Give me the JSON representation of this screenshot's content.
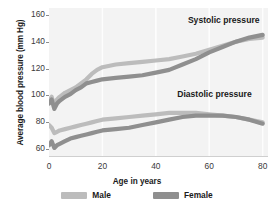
{
  "chart_data": {
    "type": "line",
    "title": "",
    "xlabel": "Age in years",
    "ylabel": "Average blood pressure (mm Hg)",
    "xlim": [
      0,
      82
    ],
    "ylim": [
      55,
      165
    ],
    "xticks": [
      0,
      20,
      40,
      60,
      80
    ],
    "yticks": [
      60,
      80,
      100,
      120,
      140,
      160
    ],
    "grid": "faint-vertical",
    "legend_position": "bottom-center",
    "annotations": [
      {
        "text": "Systolic pressure",
        "x": 52,
        "y": 155
      },
      {
        "text": "Diastolic pressure",
        "x": 48,
        "y": 100
      }
    ],
    "series": [
      {
        "name": "Male systolic",
        "sex": "Male",
        "measure": "Systolic",
        "color": "#bcbcbc",
        "x": [
          0,
          1,
          2,
          3,
          4,
          6,
          8,
          10,
          12,
          14,
          16,
          18,
          20,
          25,
          30,
          35,
          40,
          45,
          50,
          55,
          60,
          65,
          70,
          75,
          80
        ],
        "y": [
          96,
          99,
          93,
          97,
          99,
          102,
          104,
          106,
          109,
          112,
          116,
          119,
          121,
          123,
          124,
          125,
          126,
          127,
          129,
          131,
          134,
          137,
          140,
          142,
          143
        ]
      },
      {
        "name": "Female systolic",
        "sex": "Female",
        "measure": "Systolic",
        "color": "#8f8f8f",
        "x": [
          0,
          1,
          2,
          3,
          4,
          6,
          8,
          10,
          12,
          14,
          16,
          18,
          20,
          25,
          30,
          35,
          40,
          45,
          50,
          55,
          60,
          65,
          70,
          75,
          80
        ],
        "y": [
          94,
          97,
          90,
          94,
          96,
          99,
          101,
          104,
          106,
          109,
          110,
          111,
          112,
          113,
          114,
          115,
          117,
          119,
          123,
          127,
          132,
          136,
          140,
          143,
          145
        ]
      },
      {
        "name": "Male diastolic",
        "sex": "Male",
        "measure": "Diastolic",
        "color": "#bcbcbc",
        "x": [
          0,
          1,
          2,
          3,
          4,
          6,
          8,
          10,
          12,
          14,
          16,
          18,
          20,
          25,
          30,
          35,
          40,
          45,
          50,
          55,
          60,
          65,
          70,
          75,
          80
        ],
        "y": [
          78,
          76,
          72,
          73,
          74,
          75,
          76,
          77,
          78,
          79,
          80,
          81,
          82,
          83,
          84,
          85,
          86,
          87,
          87,
          87,
          86,
          85,
          84,
          82,
          80
        ]
      },
      {
        "name": "Female diastolic",
        "sex": "Female",
        "measure": "Diastolic",
        "color": "#8f8f8f",
        "x": [
          0,
          1,
          2,
          3,
          4,
          6,
          8,
          10,
          12,
          14,
          16,
          18,
          20,
          25,
          30,
          35,
          40,
          45,
          50,
          55,
          60,
          65,
          70,
          75,
          80
        ],
        "y": [
          63,
          66,
          61,
          63,
          64,
          66,
          68,
          69,
          70,
          71,
          72,
          73,
          74,
          75,
          76,
          78,
          80,
          82,
          84,
          85,
          85,
          85,
          84,
          82,
          79
        ]
      }
    ],
    "legend": [
      {
        "label": "Male",
        "color": "#bcbcbc"
      },
      {
        "label": "Female",
        "color": "#8f8f8f"
      }
    ]
  }
}
